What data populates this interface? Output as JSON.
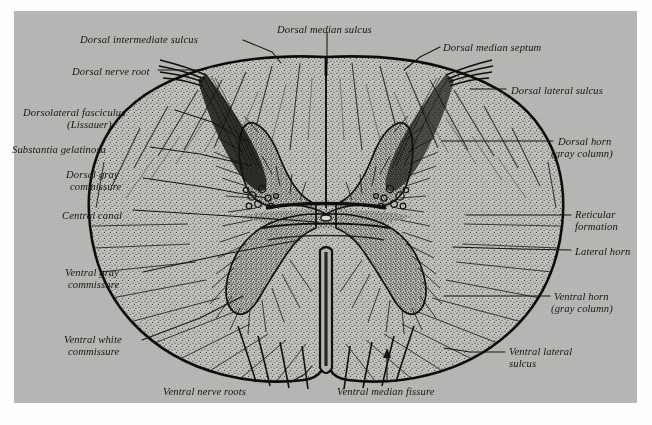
{
  "figure": {
    "caption": "",
    "plate_color": "#b9b9b7",
    "ink_color": "#15140f",
    "page_color": "#fdfdfc"
  },
  "labels_left": [
    {
      "id": "dorsal-intermediate-sulcus",
      "text": "Dorsal intermediate sulcus",
      "x": 80,
      "y": 34,
      "align": "left"
    },
    {
      "id": "dorsal-nerve-root",
      "text": "Dorsal nerve root",
      "x": 72,
      "y": 66,
      "align": "left"
    },
    {
      "id": "dorsolateral-fasciculus",
      "text": "Dorsolateral fasciculus",
      "x": 23,
      "y": 107,
      "align": "left"
    },
    {
      "id": "dorsolateral-fasciculus-sub",
      "text": "(Lissauer)",
      "x": 67,
      "y": 119,
      "align": "left"
    },
    {
      "id": "substantia-gelatinosa",
      "text": "Substantia gelatinosa",
      "x": 12,
      "y": 144,
      "align": "left"
    },
    {
      "id": "dorsal-gray-commissure",
      "text": "Dorsal gray",
      "x": 66,
      "y": 169,
      "align": "left"
    },
    {
      "id": "dorsal-gray-commissure-sub",
      "text": "commissure",
      "x": 70,
      "y": 181,
      "align": "left"
    },
    {
      "id": "central-canal",
      "text": "Central canal",
      "x": 62,
      "y": 210,
      "align": "left"
    },
    {
      "id": "ventral-gray-commissure",
      "text": "Ventral gray",
      "x": 65,
      "y": 267,
      "align": "left"
    },
    {
      "id": "ventral-gray-commissure-sub",
      "text": "commissure",
      "x": 68,
      "y": 279,
      "align": "left"
    },
    {
      "id": "ventral-white-commissure",
      "text": "Ventral white",
      "x": 64,
      "y": 334,
      "align": "left"
    },
    {
      "id": "ventral-white-commissure-sub",
      "text": "commissure",
      "x": 68,
      "y": 346,
      "align": "left"
    }
  ],
  "labels_right": [
    {
      "id": "dorsal-median-septum",
      "text": "Dorsal median septum",
      "x": 443,
      "y": 42,
      "align": "left"
    },
    {
      "id": "dorsal-lateral-sulcus",
      "text": "Dorsal lateral sulcus",
      "x": 511,
      "y": 85,
      "align": "left"
    },
    {
      "id": "dorsal-horn",
      "text": "Dorsal horn",
      "x": 558,
      "y": 136,
      "align": "left"
    },
    {
      "id": "dorsal-horn-sub",
      "text": "(gray column)",
      "x": 551,
      "y": 148,
      "align": "left"
    },
    {
      "id": "reticular-formation",
      "text": "Reticular",
      "x": 575,
      "y": 209,
      "align": "left"
    },
    {
      "id": "reticular-formation-sub",
      "text": "formation",
      "x": 575,
      "y": 221,
      "align": "left"
    },
    {
      "id": "lateral-horn",
      "text": "Lateral horn",
      "x": 575,
      "y": 246,
      "align": "left"
    },
    {
      "id": "ventral-horn",
      "text": "Ventral horn",
      "x": 554,
      "y": 291,
      "align": "left"
    },
    {
      "id": "ventral-horn-sub",
      "text": "(gray column)",
      "x": 551,
      "y": 303,
      "align": "left"
    },
    {
      "id": "ventral-lateral-sulcus",
      "text": "Ventral lateral",
      "x": 509,
      "y": 346,
      "align": "left"
    },
    {
      "id": "ventral-lateral-sulcus-sub",
      "text": "sulcus",
      "x": 509,
      "y": 358,
      "align": "left"
    }
  ],
  "labels_top": [
    {
      "id": "dorsal-median-sulcus",
      "text": "Dorsal median sulcus",
      "x": 277,
      "y": 24,
      "align": "left"
    }
  ],
  "labels_bottom": [
    {
      "id": "ventral-nerve-roots",
      "text": "Ventral nerve roots",
      "x": 163,
      "y": 386,
      "align": "left"
    },
    {
      "id": "ventral-median-fissure",
      "text": "Ventral median fissure",
      "x": 337,
      "y": 386,
      "align": "left"
    }
  ],
  "leader_lines": [
    {
      "id": "leader-dorsal-intermediate-sulcus",
      "points": "243,40 272,52 281,63"
    },
    {
      "id": "leader-dorsal-nerve-root",
      "points": "158,70 203,70"
    },
    {
      "id": "leader-dorsolateral-fasciculus",
      "points": "175,110 212,122 246,142"
    },
    {
      "id": "leader-substantia-gelatinosa",
      "points": "150,147 200,154 252,166"
    },
    {
      "id": "leader-dorsal-gray-commissure",
      "points": "143,178 205,187 266,198"
    },
    {
      "id": "leader-central-canal",
      "points": "133,210 230,216 318,222"
    },
    {
      "id": "leader-ventral-gray-commissure",
      "points": "143,272 225,254 300,240"
    },
    {
      "id": "leader-ventral-white-commissure",
      "points": "142,340 200,318 243,296"
    },
    {
      "id": "leader-dorsal-median-sulcus",
      "points": "327,32 327,64"
    },
    {
      "id": "leader-dorsal-median-septum",
      "points": "440,47 420,57 404,70"
    },
    {
      "id": "leader-dorsal-lateral-sulcus",
      "points": "506,89 470,89"
    },
    {
      "id": "leader-dorsal-horn",
      "points": "553,141 500,141 442,141"
    },
    {
      "id": "leader-reticular-formation",
      "points": "571,215 520,215 466,215"
    },
    {
      "id": "leader-lateral-horn",
      "points": "571,250 520,249 453,247"
    },
    {
      "id": "leader-ventral-horn",
      "points": "550,296 500,296 444,296"
    },
    {
      "id": "leader-ventral-lateral-sulcus",
      "points": "505,352 470,352 444,348"
    },
    {
      "id": "leader-ventral-nerve-roots",
      "points": "291,382 305,374 312,366"
    },
    {
      "id": "leader-ventral-median-fissure",
      "points": "387,382 387,352"
    }
  ],
  "anatomy": {
    "cord_outline_name": "spinal-cord-outline",
    "gray_matter_name": "gray-matter-butterfly",
    "central_canal_name": "central-canal-lumen",
    "ventral_fissure_name": "ventral-median-fissure-cleft"
  }
}
